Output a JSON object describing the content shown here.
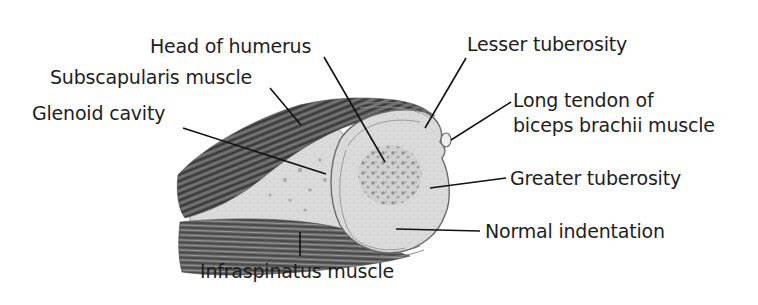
{
  "diagram": {
    "colors": {
      "background": "#ffffff",
      "label_text": "#1e1e1e",
      "leader_line": "#111111",
      "muscle_dark": "#4a4a4a",
      "muscle_mid": "#7a7a7a",
      "bone_fill": "#d9d9d9",
      "marrow_speckle": "#8f8f8f"
    },
    "labels": {
      "head_of_humerus": "Head of humerus",
      "subscapularis_muscle": "Subscapularis muscle",
      "glenoid_cavity": "Glenoid cavity",
      "lesser_tuberosity": "Lesser tuberosity",
      "long_tendon_line1": "Long tendon of",
      "long_tendon_line2": "biceps brachii muscle",
      "greater_tuberosity": "Greater tuberosity",
      "normal_indentation": "Normal indentation",
      "infraspinatus_muscle": "Infraspinatus muscle"
    }
  }
}
